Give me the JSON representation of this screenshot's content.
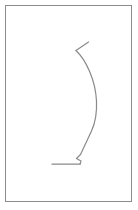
{
  "page": {
    "background_color": "#ffffff",
    "width": 138,
    "height": 210
  },
  "frame": {
    "name": "picture-frame-border",
    "x": 5,
    "y": 5,
    "width": 126,
    "height": 196,
    "stroke_color": "#8c8c8c",
    "stroke_width": 1,
    "fill_color": "#ffffff"
  },
  "drawing": {
    "name": "curved-hook-figure",
    "stroke_color": "#8a8a8a",
    "stroke_width": 1.2,
    "description": "hand-drawn hook shape: short diagonal tick at top, long bowed curve descending, small notch at bottom, horizontal baseline to the left",
    "strokes": [
      {
        "name": "top-tick-stroke",
        "path": "M 88.5 42.0 L 76.0 50.5",
        "stroke_width": 1.2
      },
      {
        "name": "main-curve-stroke",
        "path": "M 76.0 50.5 C 86.0 60.0 95.5 80.0 96.5 101.0 C 97.2 116.0 94.5 124.5 91.5 131.0 L 80.5 154.5",
        "stroke_width": 1.2
      },
      {
        "name": "bottom-notch-stroke",
        "path": "M 80.5 154.5 L 76.5 158.5 L 81.0 161.0 L 80.0 164.2",
        "stroke_width": 1.2
      },
      {
        "name": "baseline-stroke",
        "path": "M 80.0 164.2 L 52.0 164.2",
        "stroke_width": 1.2
      }
    ]
  }
}
